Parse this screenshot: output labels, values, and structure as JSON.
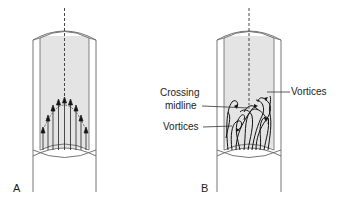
{
  "figure": {
    "panels": [
      {
        "id": "A",
        "label": "A",
        "description": "Laminar flow: parabolic velocity profile with parallel arrows in tube"
      },
      {
        "id": "B",
        "label": "B",
        "description": "Turbulent flow: tangled streamlines forming vortices",
        "annotations": {
          "crossing_midline": "Crossing\nmidline",
          "crossing_line1": "Crossing",
          "crossing_line2": "midline",
          "vortices_left": "Vortices",
          "vortices_right": "Vortices"
        }
      }
    ],
    "colors": {
      "fluid_fill": "#e4e4e4",
      "line": "#555555",
      "ink": "#111111",
      "background": "#ffffff"
    }
  }
}
